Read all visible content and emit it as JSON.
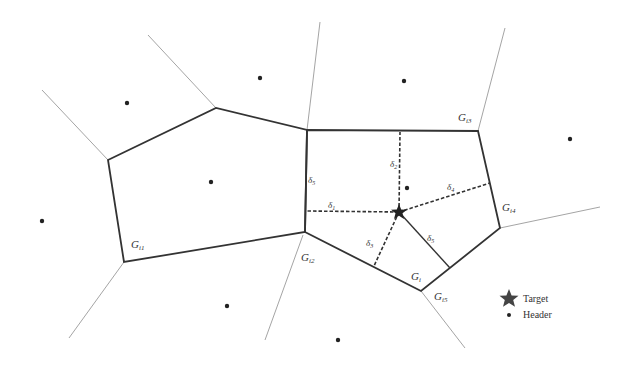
{
  "diagram": {
    "type": "voronoi-partition",
    "regions": {
      "G_i1": "G",
      "G_i1_sub": "i1",
      "G_i2": "G",
      "G_i2_sub": "i2",
      "G_i3": "G",
      "G_i3_sub": "i3",
      "G_i4": "G",
      "G_i4_sub": "i4",
      "G_i5": "G",
      "G_i5_sub": "i5",
      "G_i": "G",
      "G_i_sub": "i"
    },
    "deltas": {
      "d1": "δ",
      "d1_sub": "1",
      "d2": "δ",
      "d2_sub": "2",
      "d3": "δ",
      "d3_sub": "3",
      "d4": "δ",
      "d4_sub": "4",
      "d5": "δ",
      "d5_sub": "5",
      "d6": "δ",
      "d6_sub": "5"
    }
  },
  "legend": {
    "items": [
      {
        "symbol": "star",
        "label": "Target"
      },
      {
        "symbol": "dot",
        "label": "Header"
      }
    ]
  },
  "colors": {
    "thick_line": "#333333",
    "thin_line": "#9a9a9a",
    "marker": "#222222",
    "background": "#ffffff"
  }
}
